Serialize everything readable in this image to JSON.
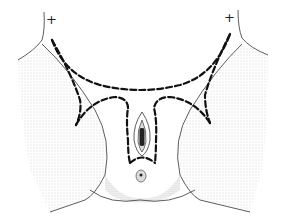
{
  "figure": {
    "type": "surgical-illustration",
    "style": "stippled pen drawing with dashed incision outlines",
    "markers": [
      {
        "label": "+",
        "x": 46,
        "y": 19
      },
      {
        "label": "+",
        "x": 224,
        "y": 17
      }
    ],
    "colors": {
      "background": "#ffffff",
      "ink": "#1a1a1a",
      "shading": "#9a9a9a"
    }
  }
}
